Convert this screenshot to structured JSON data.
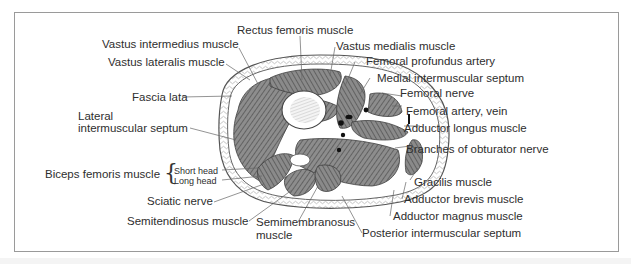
{
  "figure": {
    "labels": {
      "rectus_femoris": "Rectus femoris muscle",
      "vastus_intermedius": "Vastus intermedius muscle",
      "vastus_medialis": "Vastus medialis muscle",
      "vastus_lateralis": "Vastus lateralis muscle",
      "femoral_profundus": "Femoral profundus artery",
      "medial_septum": "Medial intermuscular septum",
      "fascia_lata": "Fascia lata",
      "femoral_nerve": "Femoral nerve",
      "lateral_septum_1": "Lateral",
      "lateral_septum_2": "intermuscular septum",
      "femoral_artery_vein": "Femoral artery, vein",
      "adductor_longus": "Adductor longus muscle",
      "obturator_branches": "Branches of obturator nerve",
      "biceps_femoris": "Biceps femoris muscle",
      "biceps_short": "Short head",
      "biceps_long": "Long head",
      "gracilis": "Gracilis muscle",
      "adductor_brevis": "Adductor brevis muscle",
      "sciatic_nerve": "Sciatic nerve",
      "adductor_magnus": "Adductor magnus muscle",
      "semitendinosus": "Semitendinosus muscle",
      "semimembranosus_1": "Semimembranosus",
      "semimembranosus_2": "muscle",
      "posterior_septum": "Posterior intermuscular septum"
    },
    "colors": {
      "line": "#555555",
      "muscle_fill": "#7a7a7a",
      "frame": "#9a9a9a",
      "text": "#2e2e2e"
    }
  }
}
